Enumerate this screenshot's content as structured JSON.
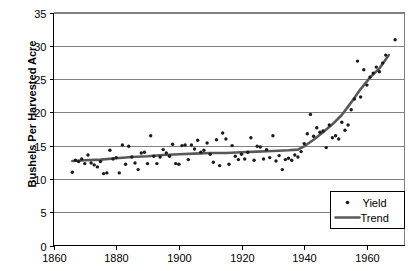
{
  "chart_data": {
    "type": "scatter",
    "title": "",
    "xlabel": "",
    "ylabel": "Bushels Per Harvested Acre",
    "xlim": [
      1860,
      1972
    ],
    "ylim": [
      0,
      35
    ],
    "xticks": [
      1860,
      1880,
      1900,
      1920,
      1940,
      1960
    ],
    "yticks": [
      0,
      5,
      10,
      15,
      20,
      25,
      30,
      35
    ],
    "grid": "horizontal",
    "legend_position": "bottom-right",
    "legend": [
      {
        "name": "Yield",
        "marker": "dot",
        "color": "#1a1a1a"
      },
      {
        "name": "Trend",
        "marker": "line",
        "color": "#595959"
      }
    ],
    "series": [
      {
        "name": "Yield",
        "type": "scatter",
        "marker": "dot",
        "color": "#1a1a1a",
        "points": [
          [
            1866,
            11.0
          ],
          [
            1867,
            12.8
          ],
          [
            1868,
            12.6
          ],
          [
            1869,
            13.0
          ],
          [
            1870,
            12.3
          ],
          [
            1871,
            13.6
          ],
          [
            1872,
            12.4
          ],
          [
            1873,
            12.1
          ],
          [
            1874,
            11.8
          ],
          [
            1875,
            12.6
          ],
          [
            1876,
            10.8
          ],
          [
            1877,
            10.9
          ],
          [
            1878,
            14.3
          ],
          [
            1879,
            13.0
          ],
          [
            1880,
            13.2
          ],
          [
            1881,
            10.9
          ],
          [
            1882,
            15.1
          ],
          [
            1883,
            12.2
          ],
          [
            1884,
            14.9
          ],
          [
            1885,
            13.3
          ],
          [
            1886,
            12.4
          ],
          [
            1887,
            11.4
          ],
          [
            1888,
            13.9
          ],
          [
            1889,
            14.0
          ],
          [
            1890,
            12.3
          ],
          [
            1891,
            16.5
          ],
          [
            1892,
            13.4
          ],
          [
            1893,
            12.3
          ],
          [
            1894,
            13.3
          ],
          [
            1895,
            14.4
          ],
          [
            1896,
            13.9
          ],
          [
            1897,
            13.4
          ],
          [
            1898,
            15.2
          ],
          [
            1899,
            12.3
          ],
          [
            1900,
            12.2
          ],
          [
            1901,
            15.0
          ],
          [
            1902,
            15.1
          ],
          [
            1903,
            12.9
          ],
          [
            1904,
            15.1
          ],
          [
            1905,
            14.5
          ],
          [
            1906,
            15.8
          ],
          [
            1907,
            14.0
          ],
          [
            1908,
            14.3
          ],
          [
            1909,
            15.4
          ],
          [
            1910,
            13.7
          ],
          [
            1911,
            12.5
          ],
          [
            1912,
            15.9
          ],
          [
            1913,
            12.0
          ],
          [
            1914,
            16.9
          ],
          [
            1915,
            16.0
          ],
          [
            1916,
            12.2
          ],
          [
            1917,
            15.0
          ],
          [
            1918,
            13.4
          ],
          [
            1919,
            12.9
          ],
          [
            1920,
            13.7
          ],
          [
            1921,
            13.0
          ],
          [
            1922,
            14.0
          ],
          [
            1923,
            16.2
          ],
          [
            1924,
            12.8
          ],
          [
            1925,
            14.9
          ],
          [
            1926,
            14.8
          ],
          [
            1927,
            13.0
          ],
          [
            1928,
            14.4
          ],
          [
            1929,
            13.2
          ],
          [
            1930,
            16.5
          ],
          [
            1931,
            12.7
          ],
          [
            1932,
            13.5
          ],
          [
            1933,
            11.4
          ],
          [
            1934,
            12.9
          ],
          [
            1935,
            13.1
          ],
          [
            1936,
            12.8
          ],
          [
            1937,
            13.6
          ],
          [
            1938,
            13.3
          ],
          [
            1939,
            14.1
          ],
          [
            1940,
            15.3
          ],
          [
            1941,
            16.8
          ],
          [
            1942,
            19.7
          ],
          [
            1943,
            16.4
          ],
          [
            1944,
            17.7
          ],
          [
            1945,
            17.0
          ],
          [
            1946,
            17.2
          ],
          [
            1947,
            14.7
          ],
          [
            1948,
            18.1
          ],
          [
            1949,
            16.2
          ],
          [
            1950,
            16.5
          ],
          [
            1951,
            16.0
          ],
          [
            1952,
            18.5
          ],
          [
            1953,
            17.3
          ],
          [
            1954,
            18.1
          ],
          [
            1955,
            20.4
          ],
          [
            1956,
            22.0
          ],
          [
            1957,
            27.7
          ],
          [
            1958,
            22.3
          ],
          [
            1959,
            26.4
          ],
          [
            1960,
            24.1
          ],
          [
            1961,
            25.3
          ],
          [
            1962,
            25.9
          ],
          [
            1963,
            26.8
          ],
          [
            1964,
            26.1
          ],
          [
            1965,
            27.4
          ],
          [
            1966,
            28.6
          ],
          [
            1969,
            30.9
          ]
        ]
      },
      {
        "name": "Trend",
        "type": "line",
        "color": "#595959",
        "points": [
          [
            1866,
            12.7
          ],
          [
            1870,
            12.8
          ],
          [
            1875,
            12.9
          ],
          [
            1880,
            13.1
          ],
          [
            1885,
            13.3
          ],
          [
            1890,
            13.4
          ],
          [
            1895,
            13.6
          ],
          [
            1900,
            13.7
          ],
          [
            1905,
            13.8
          ],
          [
            1910,
            13.9
          ],
          [
            1915,
            13.9
          ],
          [
            1920,
            14.0
          ],
          [
            1925,
            14.1
          ],
          [
            1930,
            14.2
          ],
          [
            1935,
            14.3
          ],
          [
            1938,
            14.4
          ],
          [
            1940,
            14.9
          ],
          [
            1943,
            15.9
          ],
          [
            1946,
            17.0
          ],
          [
            1949,
            18.2
          ],
          [
            1952,
            19.6
          ],
          [
            1955,
            21.5
          ],
          [
            1958,
            23.5
          ],
          [
            1961,
            25.2
          ],
          [
            1964,
            26.6
          ],
          [
            1967,
            28.6
          ]
        ]
      }
    ]
  },
  "axis": {
    "y_title": "Bushels Per Harvested Acre",
    "y_tick_labels": [
      "0",
      "5",
      "10",
      "15",
      "20",
      "25",
      "30",
      "35"
    ],
    "x_tick_labels": [
      "1860",
      "1880",
      "1900",
      "1920",
      "1940",
      "1960"
    ]
  },
  "legend": {
    "yield_label": "Yield",
    "trend_label": "Trend"
  },
  "colors": {
    "point": "#1a1a1a",
    "trend": "#595959",
    "grid": "#808080",
    "axis": "#000000",
    "background": "#ffffff"
  }
}
